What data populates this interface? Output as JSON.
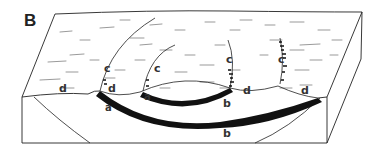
{
  "figure": {
    "panel_label": "B",
    "type": "block diagram",
    "colors": {
      "line": "#222222",
      "slip_surface": "#111111",
      "background": "#ffffff",
      "label": "#333333"
    },
    "labels": {
      "c1": "c",
      "c2": "c",
      "c3": "c",
      "c4": "c",
      "d1": "d",
      "d2": "d",
      "d3": "d",
      "d4": "d",
      "a1": "a",
      "a2": "a",
      "b1": "b",
      "b2": "b"
    }
  }
}
